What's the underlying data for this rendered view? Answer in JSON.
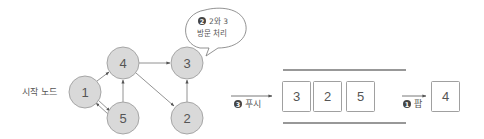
{
  "graph": {
    "start_label": "시작 노드",
    "nodes": [
      {
        "id": "1",
        "label": "1"
      },
      {
        "id": "4",
        "label": "4"
      },
      {
        "id": "5",
        "label": "5"
      },
      {
        "id": "3",
        "label": "3"
      },
      {
        "id": "2",
        "label": "2"
      }
    ],
    "edges": [
      {
        "from": "1",
        "to": "4"
      },
      {
        "from": "1",
        "to": "5"
      },
      {
        "from": "5",
        "to": "1"
      },
      {
        "from": "5",
        "to": "4"
      },
      {
        "from": "4",
        "to": "3"
      },
      {
        "from": "4",
        "to": "2"
      },
      {
        "from": "2",
        "to": "3"
      }
    ],
    "node_fill": "#d9d9d9",
    "node_stroke": "#a6a6a6"
  },
  "bubble": {
    "step_number": "2",
    "line1": "2와 3",
    "line2": "방문 처리"
  },
  "stack": {
    "push_step": "3",
    "push_label": "푸시",
    "items": [
      "3",
      "2",
      "5"
    ],
    "pop_step": "1",
    "pop_label": "팝",
    "popped_item": "4"
  }
}
